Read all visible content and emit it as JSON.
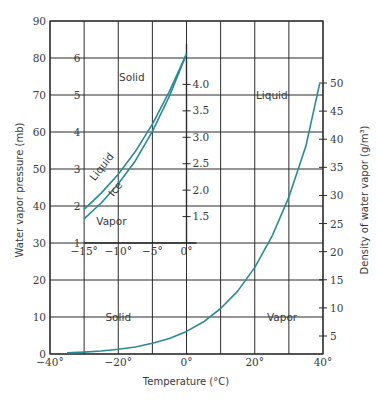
{
  "chart_data": {
    "type": "line",
    "title": "",
    "xlabel": "Temperature (°C)",
    "ylabel": "Water vapor pressure (mb)",
    "y2label": "Density of water vapor (g/m³)",
    "xlim": [
      -40,
      40
    ],
    "ylim": [
      0,
      90
    ],
    "grid": true,
    "x_ticks": [
      -40,
      -30,
      -20,
      -10,
      0,
      10,
      20,
      30,
      40
    ],
    "x_tick_labels": [
      "−40°",
      "",
      "−20°",
      "",
      "0°",
      "",
      "20°",
      "",
      "40°"
    ],
    "y_ticks": [
      0,
      10,
      20,
      30,
      40,
      50,
      60,
      70,
      80,
      90
    ],
    "y2_ticks": [
      5,
      10,
      15,
      20,
      25,
      30,
      35,
      40,
      45,
      50
    ],
    "series": [
      {
        "name": "Saturation vapor pressure (over water)",
        "x": [
          -35,
          -30,
          -25,
          -20,
          -15,
          -10,
          -5,
          0,
          5,
          10,
          15,
          20,
          25,
          30,
          35,
          39
        ],
        "values": [
          0.3,
          0.5,
          0.8,
          1.3,
          1.9,
          2.9,
          4.2,
          6.1,
          8.7,
          12.3,
          17.0,
          23.4,
          31.7,
          42.4,
          56.2,
          73.0
        ]
      }
    ],
    "regions": [
      {
        "label": "Liquid",
        "x": 25,
        "y": 70
      },
      {
        "label": "Solid",
        "x": -20,
        "y": 10
      },
      {
        "label": "Vapor",
        "x": 28,
        "y": 10
      }
    ],
    "inset": {
      "xlim": [
        -15,
        0
      ],
      "ylim": [
        1,
        6
      ],
      "x_ticks": [
        -15,
        -10,
        -5,
        0
      ],
      "x_tick_labels": [
        "−15°",
        "−10°",
        "−5°",
        "0°"
      ],
      "y_ticks": [
        1,
        2,
        3,
        4,
        5,
        6
      ],
      "y2_ticks": [
        1.5,
        2.0,
        2.5,
        3.0,
        3.5,
        4.0
      ],
      "y2_tick_labels": [
        "1.5",
        "2.0",
        "2.5",
        "3.0",
        "3.5",
        "4.0"
      ],
      "series": [
        {
          "name": "Liquid",
          "x": [
            -15,
            -12.5,
            -10,
            -7.5,
            -5,
            -2.5,
            0
          ],
          "values": [
            1.91,
            2.35,
            2.86,
            3.47,
            4.21,
            5.1,
            6.11
          ]
        },
        {
          "name": "Ice",
          "x": [
            -15,
            -12.5,
            -10,
            -7.5,
            -5,
            -2.5,
            0
          ],
          "values": [
            1.65,
            2.08,
            2.6,
            3.22,
            4.02,
            4.97,
            6.11
          ]
        }
      ],
      "regions": [
        {
          "label": "Solid",
          "x": -8,
          "y": 5.5
        },
        {
          "label": "Vapor",
          "x": -11,
          "y": 1.6
        }
      ],
      "curve_labels": [
        {
          "label": "Liquid",
          "x": -12,
          "y": 3.0
        },
        {
          "label": "Ice",
          "x": -10,
          "y": 2.4
        }
      ]
    }
  },
  "colors": {
    "curve": "#2a8a96",
    "grid": "#2b2b2b",
    "text": "#3a3a3a",
    "background": "#ffffff"
  }
}
